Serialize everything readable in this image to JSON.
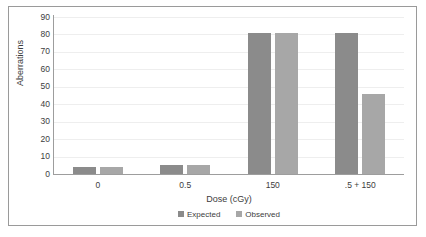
{
  "chart_data": {
    "type": "bar",
    "title": "",
    "xlabel": "Dose (cGy)",
    "ylabel": "Aberrations",
    "categories": [
      "0",
      "0.5",
      "150",
      ".5 + 150"
    ],
    "series": [
      {
        "name": "Expected",
        "color": "#8b8b8b",
        "values": [
          4,
          5,
          81,
          81
        ]
      },
      {
        "name": "Observed",
        "color": "#a7a7a7",
        "values": [
          4,
          5,
          81,
          46
        ]
      }
    ],
    "ylim": [
      0,
      90
    ],
    "yticks": [
      0,
      10,
      20,
      30,
      40,
      50,
      60,
      70,
      80,
      90
    ],
    "ytick_labels": [
      "0",
      "10",
      "20",
      "30",
      "40",
      "50",
      "60",
      "70",
      "80",
      "90"
    ],
    "grid": true,
    "grid_axis": "y",
    "legend_position": "bottom",
    "legend_entries": [
      "Expected",
      "Observed"
    ]
  }
}
